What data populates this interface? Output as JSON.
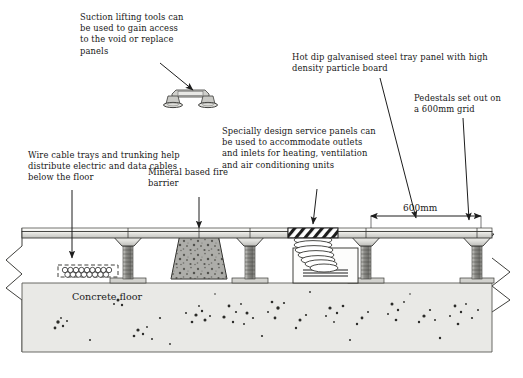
{
  "diagram": {
    "background": "#ffffff",
    "ink": "#171717"
  },
  "labels": {
    "suction": "Suction lifting tools can\nbe used to gain access\nto the void or replace\npanels",
    "hot_dip": "Hot dip galvanised steel tray panel with high\ndensity particle board",
    "pedestals": "Pedestals set out on\na 600mm grid",
    "service_panels": "Specially design service panels can\nbe used to accommodate outlets\nand inlets for heating, ventilation\nand air conditioning units",
    "wire_trays": "Wire cable trays and trunking help\ndistribute electric and data cables\nbelow the floor",
    "fire_barrier": "Mineral based fire\nbarrier",
    "dimension": "600mm",
    "concrete": "Concrete floor"
  },
  "colors": {
    "panel_face": "#d8d8d4",
    "panel_top": "#f2f2ef",
    "pedestal_head": "#e6e6e2",
    "pedestal_shaft": "#8e8e8a",
    "concrete_fill": "#e9e9e6",
    "fire_barrier": "#b4b4b0",
    "hatch": "#ffffff",
    "duct": "#ffffff"
  },
  "parts": {
    "pedestal_count": 5,
    "grid_spacing_mm": 600,
    "panel_label": "steel tray panel",
    "barrier_label": "mineral fire barrier",
    "duct_label": "flexible duct",
    "tray_label": "cable tray",
    "suction_tool_label": "suction lifting tool"
  }
}
